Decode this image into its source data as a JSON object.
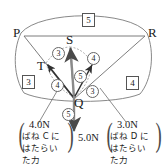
{
  "figure": {
    "type": "force-vector-diagram",
    "points": [
      {
        "id": "P",
        "label": "P",
        "x": 21,
        "y": 33
      },
      {
        "id": "R",
        "label": "R",
        "x": 147,
        "y": 33
      },
      {
        "id": "S",
        "label": "S",
        "x": 70,
        "y": 44
      },
      {
        "id": "T",
        "label": "T",
        "x": 43,
        "y": 65
      },
      {
        "id": "Q",
        "label": "Q",
        "x": 74,
        "y": 99
      }
    ],
    "box_numbers": [
      {
        "name": "top",
        "value": "5",
        "x": 82,
        "y": 13
      },
      {
        "name": "left",
        "value": "3",
        "x": 22,
        "y": 75
      },
      {
        "name": "right",
        "value": "4",
        "x": 126,
        "y": 76
      }
    ],
    "circle_numbers": [
      {
        "name": "upper-left",
        "value": "3",
        "x": 52,
        "y": 47
      },
      {
        "name": "upper-right",
        "value": "4",
        "x": 87,
        "y": 52
      },
      {
        "name": "center",
        "value": "5",
        "x": 74,
        "y": 70
      },
      {
        "name": "lower-left",
        "value": "4",
        "x": 51,
        "y": 79
      },
      {
        "name": "lower-right",
        "value": "3",
        "x": 86,
        "y": 85
      },
      {
        "name": "below-q",
        "value": "5",
        "x": 62,
        "y": 108
      }
    ],
    "force_labels": {
      "left": {
        "magnitude": "4.0N",
        "caption_lines": [
          "ばね C に",
          "はたらい",
          "た力"
        ]
      },
      "right": {
        "magnitude": "3.0N",
        "caption_lines": [
          "ばね D に",
          "はたらい",
          "た力"
        ]
      },
      "bottom": {
        "magnitude": "5.0N"
      }
    },
    "colors": {
      "line": "#6e6e6e",
      "vector": "#3a3a3a",
      "text": "#1a1a1a",
      "background": "#ffffff"
    }
  }
}
